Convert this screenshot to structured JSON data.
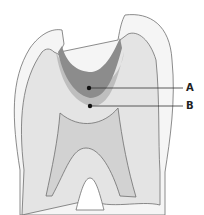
{
  "diagram": {
    "labels": [
      {
        "id": "A",
        "text": "A"
      },
      {
        "id": "B",
        "text": "B"
      }
    ],
    "colors": {
      "enamel": "#f5f5f5",
      "dentin": "#e4e4e4",
      "pulp": "#d2d2d2",
      "lesion_dark": "#8c8c8c",
      "lesion_halo": "#b4b4b4",
      "outline": "#6e6e6e",
      "leader": "#333333"
    }
  }
}
